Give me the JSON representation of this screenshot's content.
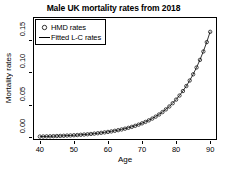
{
  "chart_data": {
    "type": "scatter",
    "title": "Male UK mortality rates from 2018",
    "xlabel": "Age",
    "ylabel": "Mortality rates",
    "xlim": [
      38,
      92
    ],
    "ylim": [
      -0.004,
      0.185
    ],
    "xticks": [
      40,
      50,
      60,
      70,
      80,
      90
    ],
    "xtick_labels": [
      "40",
      "50",
      "60",
      "70",
      "80",
      "90"
    ],
    "yticks": [
      0.0,
      0.05,
      0.1,
      0.15
    ],
    "ytick_labels": [
      "0.00",
      "0.05",
      "0.10",
      "0.15"
    ],
    "grid": false,
    "legend_position": "top-left",
    "legend": [
      {
        "label": "HMD rates",
        "marker": "circle"
      },
      {
        "label": "Fitted L-C rates",
        "marker": "line"
      }
    ],
    "x": [
      40,
      41,
      42,
      43,
      44,
      45,
      46,
      47,
      48,
      49,
      50,
      51,
      52,
      53,
      54,
      55,
      56,
      57,
      58,
      59,
      60,
      61,
      62,
      63,
      64,
      65,
      66,
      67,
      68,
      69,
      70,
      71,
      72,
      73,
      74,
      75,
      76,
      77,
      78,
      79,
      80,
      81,
      82,
      83,
      84,
      85,
      86,
      87,
      88,
      89,
      90
    ],
    "series": [
      {
        "name": "HMD rates",
        "marker": "circle",
        "values": [
          0.0013,
          0.0014,
          0.0016,
          0.0017,
          0.0019,
          0.0021,
          0.0023,
          0.0025,
          0.0028,
          0.003,
          0.0033,
          0.0036,
          0.004,
          0.0044,
          0.0048,
          0.0053,
          0.0058,
          0.0064,
          0.007,
          0.0077,
          0.0084,
          0.0092,
          0.0101,
          0.0111,
          0.0122,
          0.0134,
          0.0147,
          0.0162,
          0.0178,
          0.0196,
          0.0216,
          0.0238,
          0.0262,
          0.0289,
          0.0319,
          0.0352,
          0.0389,
          0.043,
          0.0475,
          0.0525,
          0.0581,
          0.0643,
          0.0712,
          0.0789,
          0.0874,
          0.0969,
          0.1074,
          0.1191,
          0.132,
          0.1464,
          0.1622
        ]
      },
      {
        "name": "Fitted L-C rates",
        "marker": "line",
        "values": [
          0.0013,
          0.0014,
          0.0015,
          0.0017,
          0.0019,
          0.0021,
          0.0023,
          0.0025,
          0.0027,
          0.003,
          0.0033,
          0.0036,
          0.004,
          0.0044,
          0.0048,
          0.0053,
          0.0058,
          0.0064,
          0.007,
          0.0077,
          0.0085,
          0.0093,
          0.0102,
          0.0112,
          0.0123,
          0.0135,
          0.0149,
          0.0163,
          0.018,
          0.0198,
          0.0218,
          0.024,
          0.0264,
          0.0291,
          0.0321,
          0.0354,
          0.0391,
          0.0432,
          0.0477,
          0.0527,
          0.0583,
          0.0645,
          0.0714,
          0.079,
          0.0875,
          0.097,
          0.1075,
          0.1192,
          0.1322,
          0.1466,
          0.1625
        ]
      }
    ]
  }
}
